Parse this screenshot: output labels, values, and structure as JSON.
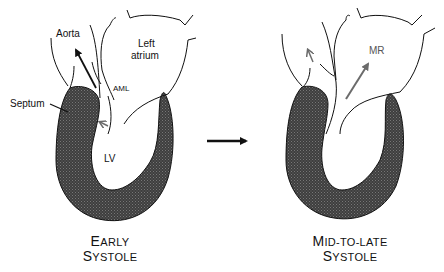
{
  "figure": {
    "panels": [
      {
        "id": "early",
        "caption_line1_initial": "E",
        "caption_line1_rest": "ARLY",
        "caption_line2_initial": "S",
        "caption_line2_rest": "YSTOLE",
        "labels": {
          "aorta": "Aorta",
          "left_atrium_1": "Left",
          "left_atrium_2": "atrium",
          "aml": "AML",
          "septum": "Septum",
          "lv": "LV"
        }
      },
      {
        "id": "mid-to-late",
        "caption_line1_initial": "M",
        "caption_line1_rest": "ID-TO-LATE",
        "caption_line2_initial": "S",
        "caption_line2_rest": "YSTOLE",
        "labels": {
          "mr": "MR"
        }
      }
    ],
    "transition_arrow": "right-arrow",
    "colors": {
      "myocardium": "#3a3a3a",
      "outline": "#111111",
      "flow_arrow_gray": "#6b6b6b"
    }
  }
}
